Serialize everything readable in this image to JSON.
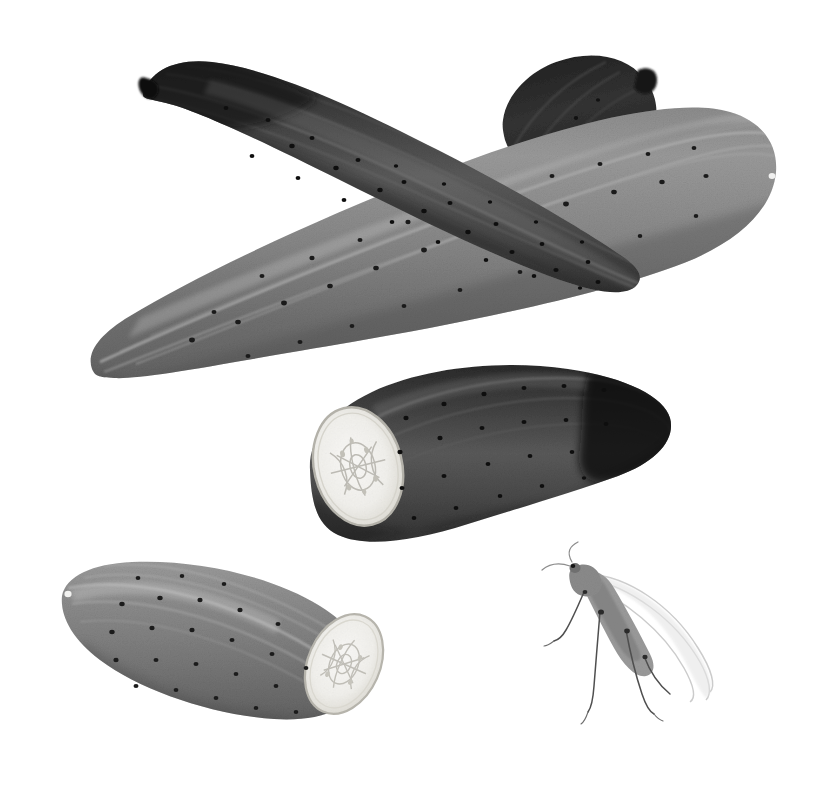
{
  "plate": {
    "kind": "botanical-illustration",
    "subject": "Cucumber (Cucumis sativus) fruits with insect",
    "medium": "graphite / monochrome wash drawing",
    "background_color": "#ffffff",
    "border_color": "#919191",
    "caption": ""
  },
  "palette": {
    "paper": "#ffffff",
    "rule_gray": "#919191",
    "skin_dark": "#3b3b3b",
    "skin_darkest": "#222222",
    "skin_mid": "#6e6e6e",
    "skin_light": "#8e8e8e",
    "skin_highlight": "#b6b6b6",
    "cut_flesh": "#f2f1ee",
    "cut_rim": "#cfcdc6",
    "seed_gray": "#b9b7b1",
    "wart_dark": "#1e1e1e",
    "insect_body": "#8b8b8b",
    "insect_wing": "#cfcfcf",
    "insect_leg": "#5a5a5a"
  },
  "specimens": [
    {
      "id": "cucumber-upper-dark",
      "label": "Whole fruit, dark form, upper left to right",
      "tone": "dark",
      "orientation_deg": -18,
      "cut": false,
      "wart_count": 30
    },
    {
      "id": "cucumber-upper-light",
      "label": "Whole fruit, pale form, crossing beneath",
      "tone": "mid",
      "orientation_deg": 16,
      "cut": false,
      "wart_count": 28
    },
    {
      "id": "cucumber-behind-dark",
      "label": "Partial fruit, darkest, behind crossing pair",
      "tone": "darkest",
      "orientation_deg": -52,
      "cut": false,
      "wart_count": 8
    },
    {
      "id": "cucumber-middle-cut",
      "label": "Fruit with transverse cut, centre of plate",
      "tone": "dark",
      "orientation_deg": -8,
      "cut": true,
      "cut_side": "left",
      "wart_count": 22
    },
    {
      "id": "cucumber-lower-cut",
      "label": "Fruit with transverse cut, lower left",
      "tone": "mid",
      "orientation_deg": 14,
      "cut": true,
      "cut_side": "right",
      "wart_count": 24
    }
  ],
  "insect": {
    "id": "insect-cricket",
    "label": "Winged insect, long hind legs and antennae",
    "tone": "pale gray",
    "wing_count": 3,
    "leg_count": 4,
    "antenna_count": 2
  },
  "features": {
    "cut_face_label": "Cut face showing seed cavity",
    "blossom_scar_label": "Blossom scar",
    "striation_label": "Longitudinal striations",
    "wart_label": "Surface wart"
  }
}
